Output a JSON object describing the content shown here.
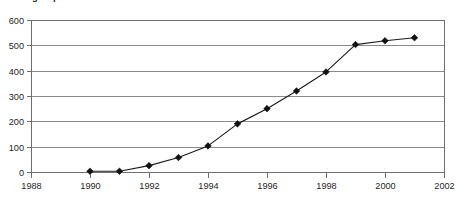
{
  "chart_data": {
    "type": "line",
    "title": "...ting Reports",
    "title_note": "clipped at top edge of screenshot",
    "xlabel": "",
    "ylabel": "",
    "x": [
      1990,
      1991,
      1992,
      1993,
      1994,
      1995,
      1996,
      1997,
      1998,
      1999,
      2000,
      2001
    ],
    "values": [
      3,
      3,
      25,
      57,
      103,
      190,
      250,
      320,
      395,
      503,
      518,
      530
    ],
    "series": [
      {
        "name": "Reports",
        "values": [
          3,
          3,
          25,
          57,
          103,
          190,
          250,
          320,
          395,
          503,
          518,
          530
        ]
      }
    ],
    "xlim": [
      1988,
      2002
    ],
    "ylim": [
      0,
      600
    ],
    "x_ticks": [
      1988,
      1990,
      1992,
      1994,
      1996,
      1998,
      2000,
      2002
    ],
    "x_tick_labels": [
      "1988",
      "1990",
      "1992",
      "1994",
      "1996",
      "1998",
      "2000",
      "2002"
    ],
    "y_ticks": [
      0,
      100,
      200,
      300,
      400,
      500,
      600
    ],
    "y_tick_labels": [
      "0",
      "100",
      "200",
      "300",
      "400",
      "500",
      "600"
    ],
    "grid": "horizontal",
    "legend": "none",
    "marker": "diamond",
    "line_color": "#1c1c1c",
    "marker_color": "#111111",
    "gridline_color": "#8a8a8a",
    "background_color": "#ffffff"
  },
  "plot_geometry": {
    "left": 31,
    "right": 444,
    "top": 20,
    "bottom": 172
  }
}
